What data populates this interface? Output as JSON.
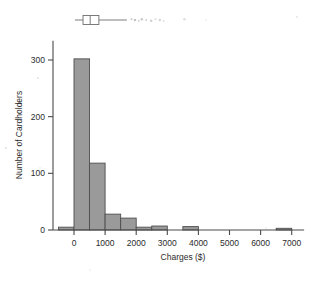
{
  "chart_data": {
    "type": "bar",
    "subtype": "histogram-with-boxplot",
    "title": "",
    "subtitle": "",
    "xlabel": "Charges ($)",
    "ylabel": "Number of Cardholders",
    "xlim": [
      -900,
      7400
    ],
    "ylim": [
      0,
      320
    ],
    "xticks": [
      0,
      1000,
      2000,
      3000,
      4000,
      5000,
      6000,
      7000
    ],
    "xtick_labels": [
      "0",
      "1000",
      "2000",
      "3000",
      "4000",
      "5000",
      "6000",
      "7000"
    ],
    "yticks": [
      0,
      100,
      200,
      300
    ],
    "ytick_labels": [
      "0",
      "100",
      "200",
      "300"
    ],
    "grid": false,
    "legend": "none",
    "bin_width": 500,
    "bins": [
      {
        "left": -500,
        "right": 0,
        "count": 5
      },
      {
        "left": 0,
        "right": 500,
        "count": 302
      },
      {
        "left": 500,
        "right": 1000,
        "count": 118
      },
      {
        "left": 1000,
        "right": 1500,
        "count": 28
      },
      {
        "left": 1500,
        "right": 2000,
        "count": 21
      },
      {
        "left": 2000,
        "right": 2500,
        "count": 5
      },
      {
        "left": 2500,
        "right": 3000,
        "count": 7
      },
      {
        "left": 3000,
        "right": 3500,
        "count": 0
      },
      {
        "left": 3500,
        "right": 4000,
        "count": 6
      },
      {
        "left": 4000,
        "right": 4500,
        "count": 0
      },
      {
        "left": 4500,
        "right": 5000,
        "count": 0
      },
      {
        "left": 5000,
        "right": 5500,
        "count": 0
      },
      {
        "left": 5500,
        "right": 6000,
        "count": 0
      },
      {
        "left": 6000,
        "right": 6500,
        "count": 0
      },
      {
        "left": 6500,
        "right": 7000,
        "count": 3
      }
    ],
    "categories": [
      "-500",
      "0",
      "500",
      "1000",
      "1500",
      "2000",
      "2500",
      "3000",
      "3500",
      "4000",
      "4500",
      "5000",
      "5500",
      "6000",
      "6500"
    ],
    "values": [
      5,
      302,
      118,
      28,
      21,
      5,
      7,
      0,
      6,
      0,
      0,
      0,
      0,
      0,
      3
    ],
    "boxplot": {
      "whisker_low": 30,
      "q1": 290,
      "median": 520,
      "q3": 800,
      "whisker_high": 1700,
      "outliers": [
        1850,
        1960,
        2080,
        2180,
        2320,
        2480,
        2620,
        2760,
        2880,
        3550
      ]
    },
    "colors": {
      "bar_fill": "#9a9a9a",
      "bar_edge": "#4e4e4e",
      "axis": "#4a4a4a",
      "text": "#2b2b2b",
      "box_edge": "#6e6e6e",
      "background": "#ffffff"
    }
  }
}
